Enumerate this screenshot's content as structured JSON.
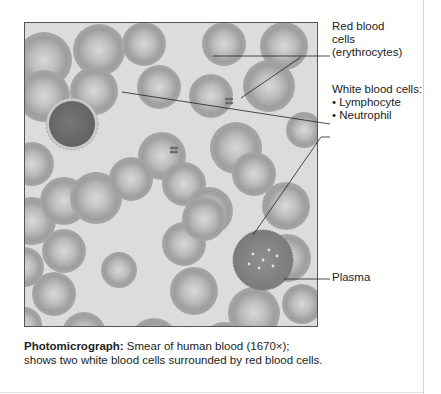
{
  "figure": {
    "labels": {
      "rbc": [
        "Red blood",
        "cells",
        "(erythrocytes)"
      ],
      "wbc_heading": "White blood cells:",
      "wbc_items": [
        "• Lymphocyte",
        "• Neutrophil"
      ],
      "plasma": "Plasma"
    },
    "caption": {
      "bold": "Photomicrograph:",
      "text": " Smear of human blood (1670×); shows two white blood cells surrounded by red blood cells."
    },
    "colors": {
      "plasma_bg": "#cfcfcf",
      "rbc_rim": "#7d7d7d",
      "rbc_center": "#c4c4c4",
      "lymphocyte": "#3e3e3e",
      "neutrophil": "#5a5a5a",
      "border": "#555555",
      "text": "#222222"
    },
    "micrograph": {
      "rbcs": [
        [
          20,
          10,
          28
        ],
        [
          75,
          2,
          26
        ],
        [
          120,
          0,
          22
        ],
        [
          200,
          0,
          22
        ],
        [
          260,
          0,
          24
        ],
        [
          20,
          48,
          26
        ],
        [
          70,
          45,
          24
        ],
        [
          135,
          43,
          22
        ],
        [
          187,
          52,
          22
        ],
        [
          245,
          38,
          26
        ],
        [
          8,
          120,
          22
        ],
        [
          138,
          110,
          24
        ],
        [
          212,
          100,
          26
        ],
        [
          280,
          90,
          18
        ],
        [
          8,
          175,
          24
        ],
        [
          40,
          155,
          24
        ],
        [
          72,
          150,
          26
        ],
        [
          107,
          135,
          22
        ],
        [
          160,
          140,
          22
        ],
        [
          230,
          130,
          22
        ],
        [
          185,
          165,
          24
        ],
        [
          262,
          160,
          24
        ],
        [
          0,
          225,
          20
        ],
        [
          40,
          207,
          22
        ],
        [
          160,
          200,
          22
        ],
        [
          180,
          175,
          22
        ],
        [
          263,
          212,
          24
        ],
        [
          30,
          250,
          22
        ],
        [
          95,
          230,
          18
        ],
        [
          170,
          245,
          24
        ],
        [
          230,
          265,
          26
        ],
        [
          278,
          262,
          20
        ],
        [
          0,
          285,
          18
        ],
        [
          60,
          290,
          22
        ],
        [
          130,
          296,
          24
        ],
        [
          200,
          300,
          22
        ]
      ],
      "lymphocyte": [
        48,
        102,
        23
      ],
      "neutrophil": [
        239,
        238,
        30
      ],
      "platelets": [
        [
          205,
          79
        ],
        [
          150,
          128
        ]
      ]
    }
  }
}
